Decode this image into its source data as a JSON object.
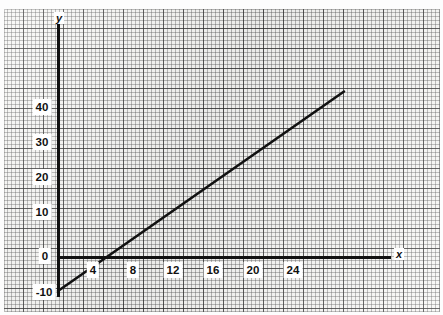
{
  "page": {
    "top_caption": "",
    "background_color": "#f7f7f5",
    "ink_color": "#111111"
  },
  "axes": {
    "y_axis_label": "y",
    "x_axis_label": "x"
  },
  "chart_data": {
    "type": "line",
    "title": "",
    "xlabel": "x",
    "ylabel": "y",
    "grid": true,
    "grid_minor_spacing_units": 0.4,
    "grid_major_spacing_units": 2,
    "legend": "none",
    "xlim": [
      -1.4,
      33
    ],
    "ylim": [
      -12,
      52
    ],
    "x_ticks": [
      4,
      8,
      12,
      16,
      20,
      24
    ],
    "x_tick_labels": [
      "4",
      "8",
      "12",
      "16",
      "20",
      "24"
    ],
    "y_ticks": [
      -10,
      0,
      10,
      20,
      30,
      40
    ],
    "y_tick_labels": [
      "-10",
      "0",
      "10",
      "20",
      "30",
      "40"
    ],
    "series": [
      {
        "name": "line",
        "equation": "y = 2.5x - 10",
        "slope": 2.5,
        "intercept": -10,
        "x": [
          0,
          4,
          8,
          12,
          16,
          20,
          24,
          28.6
        ],
        "y": [
          -10,
          0,
          10,
          20,
          30,
          40,
          50,
          61.5
        ],
        "endpoints": [
          {
            "x": 0,
            "y": -10
          },
          {
            "x": 28.6,
            "y": 47
          }
        ],
        "x_intercept": 4,
        "y_intercept": -10,
        "color": "#111111",
        "line_width_px": 2.6
      }
    ]
  },
  "ticks": {
    "x": [
      {
        "label": "4",
        "px": 93,
        "py": 270
      },
      {
        "label": "8",
        "px": 133,
        "py": 270
      },
      {
        "label": "12",
        "px": 173,
        "py": 270
      },
      {
        "label": "16",
        "px": 213,
        "py": 270
      },
      {
        "label": "20",
        "px": 253,
        "py": 270
      },
      {
        "label": "24",
        "px": 293,
        "py": 270
      }
    ],
    "y": [
      {
        "label": "40",
        "px": 42,
        "py": 107
      },
      {
        "label": "30",
        "px": 42,
        "py": 142
      },
      {
        "label": "20",
        "px": 42,
        "py": 177
      },
      {
        "label": "10",
        "px": 42,
        "py": 212
      },
      {
        "label": "0",
        "px": 45,
        "py": 256
      },
      {
        "label": "-10",
        "px": 44,
        "py": 292
      }
    ]
  }
}
